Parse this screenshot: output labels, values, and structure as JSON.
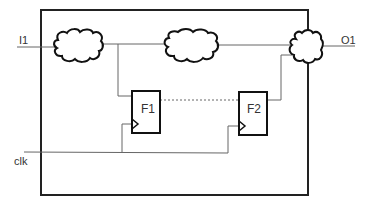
{
  "diagram": {
    "inputs": [
      {
        "label": "I1"
      },
      {
        "label": "clk"
      }
    ],
    "outputs": [
      {
        "label": "O1"
      }
    ],
    "flipflops": [
      {
        "label": "F1"
      },
      {
        "label": "F2"
      }
    ],
    "clouds": [
      {
        "name": "logic-cloud-1"
      },
      {
        "name": "logic-cloud-2"
      },
      {
        "name": "logic-cloud-3"
      }
    ],
    "colors": {
      "stroke": "#222222",
      "wire": "#555555",
      "text": "#333333"
    }
  }
}
